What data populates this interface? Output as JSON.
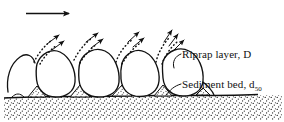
{
  "figure": {
    "background_color": "#ffffff",
    "ink_color": "#111111",
    "width": 284,
    "height": 122
  },
  "flow_arrow": {
    "name": "flow-direction-arrow",
    "direction": "right",
    "x1": 26,
    "y1": 13,
    "x2": 72,
    "y2": 13
  },
  "labels": {
    "riprap": {
      "text": "Riprap layer, D",
      "symbol": "D",
      "leader_from_x": 182,
      "leader_to_x": 166,
      "y": 54
    },
    "sediment": {
      "text": "Sediment bed, d",
      "subscript": "50",
      "symbol": "d50",
      "leader_from_x": 182,
      "leader_to_x": 166,
      "y": 84
    }
  },
  "riprap_stones": {
    "count": 4,
    "shape": "egg",
    "stones": [
      {
        "cx": 55,
        "cy": 75,
        "rx": 21,
        "ry": 27,
        "tilt": -4
      },
      {
        "cx": 98,
        "cy": 75,
        "rx": 22,
        "ry": 28,
        "tilt": 2
      },
      {
        "cx": 140,
        "cy": 75,
        "rx": 21,
        "ry": 27,
        "tilt": -3
      },
      {
        "cx": 181,
        "cy": 74,
        "rx": 22,
        "ry": 28,
        "tilt": 3
      }
    ],
    "partial_stone_left": {
      "cx": 20,
      "cy": 72,
      "rx": 14,
      "ry": 20
    }
  },
  "ejection_plumes": {
    "description": "Dotted sediment particle trajectories with arrowheads escaping through riprap voids",
    "clusters": [
      {
        "origin_x": 40,
        "origin_y": 56,
        "arrows": 2,
        "angle_deg": -52
      },
      {
        "origin_x": 78,
        "origin_y": 54,
        "arrows": 2,
        "angle_deg": -55
      },
      {
        "origin_x": 120,
        "origin_y": 55,
        "arrows": 2,
        "angle_deg": -58
      },
      {
        "origin_x": 160,
        "origin_y": 54,
        "arrows": 3,
        "angle_deg": -62
      }
    ]
  },
  "sediment_bed": {
    "name": "sediment-bed",
    "surface_y": 97,
    "bottom_y": 119,
    "fill_pattern": "stipple",
    "stipple_density": "medium"
  }
}
